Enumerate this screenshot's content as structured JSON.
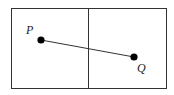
{
  "diagram": {
    "points": [
      {
        "id": "P",
        "label": "P"
      },
      {
        "id": "Q",
        "label": "Q"
      }
    ],
    "segment": {
      "from": "P",
      "to": "Q"
    },
    "colors": {
      "stroke": "#222222",
      "point": "#000000",
      "background": "#ffffff"
    }
  }
}
